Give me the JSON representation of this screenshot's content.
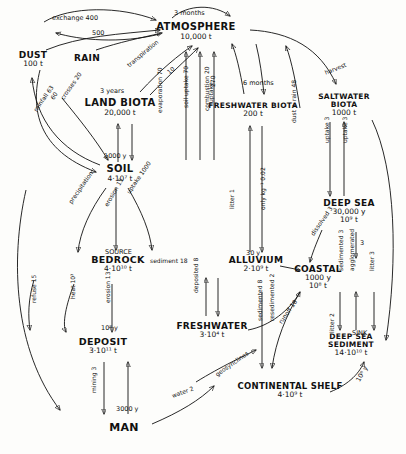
{
  "figure": {
    "type": "flow-diagram",
    "caption": ""
  },
  "nodes": [
    {
      "id": "atmosphere",
      "name": "ATMOSPHERE",
      "value": "10,000 t",
      "x": 196,
      "y": 31,
      "fs": 10,
      "vfs": 7.5
    },
    {
      "id": "dust",
      "name": "DUST",
      "value": "100 t",
      "x": 33,
      "y": 60,
      "fs": 9,
      "vfs": 7.5
    },
    {
      "id": "rain",
      "name": "RAIN",
      "value": "",
      "x": 87,
      "y": 59,
      "fs": 9,
      "vfs": 7.5
    },
    {
      "id": "land_biota",
      "name": "LAND BIOTA",
      "value": "20,000 t",
      "x": 120,
      "y": 107,
      "fs": 10,
      "vfs": 7.5
    },
    {
      "id": "soil",
      "name": "SOIL",
      "value": "4·10⁷ t",
      "x": 120,
      "y": 173,
      "fs": 10,
      "vfs": 7.5
    },
    {
      "id": "freshwater_biota",
      "name": "FRESHWATER BIOTA",
      "value": "200 t",
      "x": 253,
      "y": 110,
      "fs": 7.5,
      "vfs": 7.5
    },
    {
      "id": "saltwater_biota",
      "name": "SALTWATER BIOTA",
      "value": "1000 t",
      "x": 344,
      "y": 105,
      "fs": 7.5,
      "vfs": 7.5
    },
    {
      "id": "deep_sea",
      "name": "DEEP SEA",
      "value": "30,000 y\n10⁹ t",
      "x": 349,
      "y": 212,
      "fs": 9,
      "vfs": 7.5
    },
    {
      "id": "bedrock",
      "name": "BEDROCK",
      "value": "4·10¹⁰ t",
      "x": 118,
      "y": 264,
      "fs": 9.5,
      "vfs": 7.5
    },
    {
      "id": "alluvium",
      "name": "ALLUVIUM",
      "value": "2·10⁹ t",
      "x": 256,
      "y": 265,
      "fs": 9,
      "vfs": 7.5
    },
    {
      "id": "coastal",
      "name": "COASTAL",
      "value": "1000 y\n10⁸ t",
      "x": 318,
      "y": 278,
      "fs": 9,
      "vfs": 7.5
    },
    {
      "id": "deposit",
      "name": "DEPOSIT",
      "value": "3·10¹¹ t",
      "x": 103,
      "y": 346,
      "fs": 9.5,
      "vfs": 7.5
    },
    {
      "id": "freshwater",
      "name": "FRESHWATER",
      "value": "3·10⁴ t",
      "x": 212,
      "y": 331,
      "fs": 9,
      "vfs": 7.5
    },
    {
      "id": "deep_sea_sediment",
      "name": "DEEP SEA SEDIMENT",
      "value": "14·10¹⁰ t",
      "x": 351,
      "y": 345,
      "fs": 7.5,
      "vfs": 7.5
    },
    {
      "id": "continental_shelf",
      "name": "CONTINENTAL SHELF",
      "value": "4·10⁹ t",
      "x": 290,
      "y": 390,
      "fs": 8.5,
      "vfs": 7.5
    },
    {
      "id": "man",
      "name": "MAN",
      "value": "",
      "x": 124,
      "y": 428,
      "fs": 11,
      "vfs": 7.5
    }
  ],
  "edge_labels": [
    {
      "id": "exchange_400",
      "text": "exchange 400",
      "x": 52,
      "y": 15,
      "fs": 6.5,
      "rot": 0
    },
    {
      "id": "exchange_500",
      "text": "500",
      "x": 92,
      "y": 30,
      "fs": 6.5,
      "rot": 0
    },
    {
      "id": "three_months",
      "text": "3 months",
      "x": 174,
      "y": 10,
      "fs": 6.5,
      "rot": 0
    },
    {
      "id": "three_years",
      "text": "3 years",
      "x": 100,
      "y": 88,
      "fs": 6.5,
      "rot": 0
    },
    {
      "id": "transpiration_10",
      "text": "transpiration",
      "x": 128,
      "y": 63,
      "fs": 6,
      "rot": -40
    },
    {
      "id": "transpiration_val",
      "text": "10",
      "x": 168,
      "y": 70,
      "fs": 6,
      "rot": -40
    },
    {
      "id": "crosses_20",
      "text": "crosses 20",
      "x": 62,
      "y": 96,
      "fs": 6,
      "rot": -55
    },
    {
      "id": "rainfall_60",
      "text": "60",
      "x": 52,
      "y": 96,
      "fs": 6,
      "rot": -55
    },
    {
      "id": "rainfall_63",
      "text": "rainfall 63",
      "x": 35,
      "y": 108,
      "fs": 6,
      "rot": -55
    },
    {
      "id": "soil_uptake_70",
      "text": "soil uptake 70",
      "x": 186,
      "y": 105,
      "fs": 6,
      "rot": -90
    },
    {
      "id": "evaporation_70",
      "text": "evaporation 70",
      "x": 160,
      "y": 110,
      "fs": 6,
      "rot": -90
    },
    {
      "id": "combustion_20",
      "text": "combustion 20",
      "x": 207,
      "y": 108,
      "fs": 6,
      "rot": -90
    },
    {
      "id": "1000_y",
      "text": "1000 y",
      "x": 104,
      "y": 153,
      "fs": 6.5,
      "rot": 0
    },
    {
      "id": "precipitation",
      "text": "precipitation",
      "x": 70,
      "y": 200,
      "fs": 6,
      "rot": -55
    },
    {
      "id": "erosion_15",
      "text": "erosion 15",
      "x": 106,
      "y": 203,
      "fs": 6,
      "rot": -60
    },
    {
      "id": "uptake_1000",
      "text": "uptake 1000",
      "x": 128,
      "y": 190,
      "fs": 6,
      "rot": -55
    },
    {
      "id": "source",
      "text": "SOURCE",
      "x": 105,
      "y": 249,
      "fs": 6.5,
      "rot": 0
    },
    {
      "id": "sediment_18",
      "text": "sediment 18",
      "x": 150,
      "y": 258,
      "fs": 6,
      "rot": 0
    },
    {
      "id": "heat_103",
      "text": "heat 10³",
      "x": 73,
      "y": 296,
      "fs": 6,
      "rot": -90
    },
    {
      "id": "erosion_13",
      "text": "erosion 13",
      "x": 108,
      "y": 300,
      "fs": 6,
      "rot": -90
    },
    {
      "id": "refuse_15",
      "text": "refuse 15",
      "x": 34,
      "y": 300,
      "fs": 6,
      "rot": -90
    },
    {
      "id": "mining_3",
      "text": "mining 3",
      "x": 94,
      "y": 390,
      "fs": 6,
      "rot": -90
    },
    {
      "id": "3000_y",
      "text": "3000 y",
      "x": 116,
      "y": 406,
      "fs": 6.5,
      "rot": 0
    },
    {
      "id": "108_y",
      "text": "10⁸ y",
      "x": 101,
      "y": 325,
      "fs": 6.5,
      "rot": 0
    },
    {
      "id": "water_2",
      "text": "water 2",
      "x": 172,
      "y": 393,
      "fs": 6,
      "rot": -20
    },
    {
      "id": "geosynclines",
      "text": "geosynclines",
      "x": 216,
      "y": 372,
      "fs": 6,
      "rot": -35
    },
    {
      "id": "30_y",
      "text": "30 y",
      "x": 246,
      "y": 250,
      "fs": 6.5,
      "rot": 0
    },
    {
      "id": "deposited_8",
      "text": "deposited 8",
      "x": 196,
      "y": 290,
      "fs": 6,
      "rot": -90
    },
    {
      "id": "runoff_18",
      "text": "runoff 18",
      "x": 280,
      "y": 320,
      "fs": 6,
      "rot": -55
    },
    {
      "id": "6_months",
      "text": "6 months",
      "x": 243,
      "y": 80,
      "fs": 6.5,
      "rot": 0
    },
    {
      "id": "litter_1",
      "text": "litter 1",
      "x": 232,
      "y": 206,
      "fs": 6,
      "rot": -90
    },
    {
      "id": "uptake_270",
      "text": "270",
      "x": 213,
      "y": 84,
      "fs": 6,
      "rot": -90
    },
    {
      "id": "uptake_word",
      "text": "uptake",
      "x": 211,
      "y": 100,
      "fs": 6,
      "rot": -90
    },
    {
      "id": "only_kg_002",
      "text": "only kg⁻¹ 0.02",
      "x": 263,
      "y": 207,
      "fs": 6,
      "rot": -90
    },
    {
      "id": "dust_rain_48",
      "text": "dust + rain 48",
      "x": 294,
      "y": 120,
      "fs": 6,
      "rot": -90
    },
    {
      "id": "harvest",
      "text": "harvest",
      "x": 325,
      "y": 70,
      "fs": 6,
      "rot": -22
    },
    {
      "id": "uptake_3a",
      "text": "uptake 3",
      "x": 327,
      "y": 140,
      "fs": 6,
      "rot": -90
    },
    {
      "id": "uptake_3b",
      "text": "uptake 3",
      "x": 345,
      "y": 140,
      "fs": 6,
      "rot": -90
    },
    {
      "id": "dissolved_3",
      "text": "dissolved 3",
      "x": 312,
      "y": 232,
      "fs": 6,
      "rot": -55
    },
    {
      "id": "sea_3",
      "text": "3",
      "x": 360,
      "y": 240,
      "fs": 6.5,
      "rot": 0
    },
    {
      "id": "sedimented_3",
      "text": "sedimented 3",
      "x": 341,
      "y": 268,
      "fs": 6,
      "rot": -90
    },
    {
      "id": "agglomerated",
      "text": "agglomerated",
      "x": 352,
      "y": 268,
      "fs": 6,
      "rot": -90
    },
    {
      "id": "litter_3",
      "text": "litter 3",
      "x": 372,
      "y": 268,
      "fs": 6,
      "rot": -90
    },
    {
      "id": "sedimented_8",
      "text": "sedimented 8",
      "x": 260,
      "y": 318,
      "fs": 6,
      "rot": -90
    },
    {
      "id": "resedimented_2",
      "text": "resedimented 2",
      "x": 272,
      "y": 318,
      "fs": 6,
      "rot": -90
    },
    {
      "id": "litter_2",
      "text": "litter 2",
      "x": 332,
      "y": 330,
      "fs": 6,
      "rot": -90
    },
    {
      "id": "sink",
      "text": "SINK",
      "x": 352,
      "y": 330,
      "fs": 6.5,
      "rot": 0
    },
    {
      "id": "108_y2",
      "text": "10⁸ y",
      "x": 358,
      "y": 378,
      "fs": 6.5,
      "rot": -60
    }
  ],
  "colors": {
    "ink": "#111111",
    "paper": "#fdfdfb"
  }
}
